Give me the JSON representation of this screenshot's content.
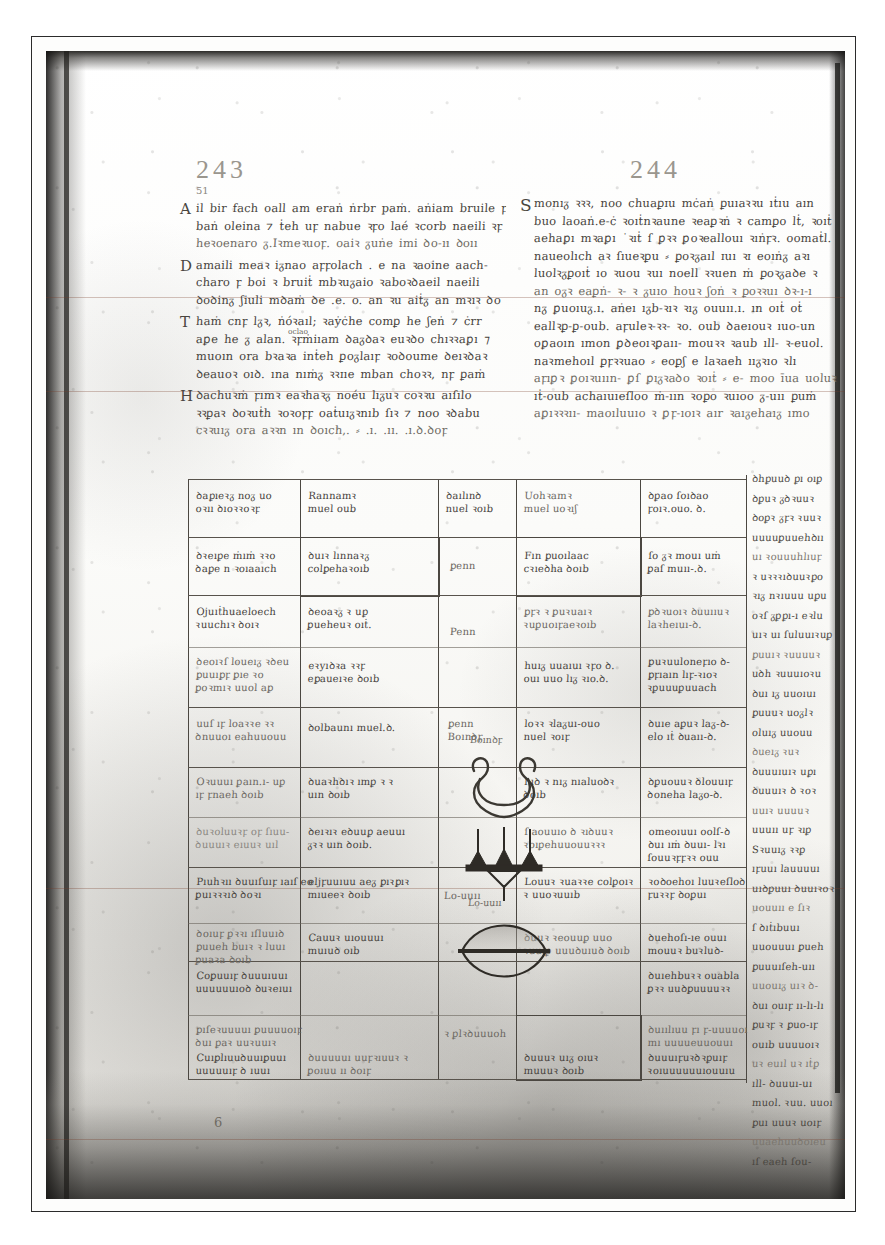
{
  "plate": {
    "caption_none": "",
    "bottom_folio_mark": "6"
  },
  "columns": {
    "left": {
      "folio_number": "243",
      "marginal_number": "51",
      "paragraphs": [
        {
          "initial": "A",
          "lines": [
            "il bir fach oall am eraṅ ṅrbr paṁ. aṅiam bruile ꝼo",
            "baṅ oleina ⁊ ṫeh uꝼ nabue ꝛꝼo laé ꝛcorb naeili ꝛꝼ",
            "heꝛoenaro ᵹ.Iꝛmeꝛuoꝼ. oaiꝛ ᵹuṅe imi ꝺo-ıı ꝺoıı"
          ]
        },
        {
          "initial": "D",
          "lines": [
            "amaili meaꝛ iᵹnao aꝼꝼolach . e na ꝛaoine aach-",
            "charo ꝼ boi ꝛ bruiṫ mbꝛuᵹaio ꝛaboꝛꝺaeil naeili",
            "ꝺoꝺinᵹ ʃiuli mꝺaṁ ꝺe .e. o. an ꝛu aiṫᵹ an mꝛıꝛ ꝺo"
          ]
        },
        {
          "initial": "T",
          "superscript": "oclao",
          "lines": [
            "haṁ cnꝼ lᵹꝛ, ṅóꝛaıl; ꝛaẏċhe comꝑ he ʃeṅ ⁊ ċrr",
            "aꝑe he ᵹ alan. ꝛꝼṁiıam ꝺaᵹꝺaꝛ euꝛꝺo chıꝛꝛaꝑı ⁊",
            "muoın ora bꝛaꝛa inṫeh ꝑoᵹlaıꝼ ꝛoꝺoume ꝺeıꝛꝺaꝛ",
            "ꝺeauoꝛ oıꝺ. ına nıṁᵹ ꝛꝛɪıe mban choꝛꝛ, nꝼ ꝑaṁ"
          ]
        },
        {
          "initial": "H",
          "lines": [
            "ꝺachuꝛṁ ꝼımꝛ eaꝛhaꝛᵹ noéu lıᵹuꝛ coꝛꝛu aıſılo",
            "ꝛꝛꝑaꝛ ꝺoꝛuṫh ꝛoꝛoꝼꝼ oaṫuıᵹꝛnıb ſıꝛ ⁊ noo ꝛꝺabu",
            "cꝛꝛuıᵹ ora aꝛꝛn ın ꝺoıch,. ⸗   .ı. .ıı. .ı.ꝺ.ꝺoꝼ"
          ]
        }
      ]
    },
    "right": {
      "folio_number": "244",
      "paragraphs": [
        {
          "initial": "S",
          "lines": [
            "monıᵹ ꝛꝛꝛ, noo chuaꝑɪu mċaṅ ꝑuıaꝛꝛu ıṫıu aın",
            "buo laoaṅ.e-ċ ꝛoıṫnꝛaune ꝛeaꝑꝛṅ ꝛ camꝑo lṫ, ꝛoıṫ",
            "aehaꝑı mꝛaꝑı ˙ꝛıṫ ſ ꝑꝛꝛ ꝑoꝛeallouı ꝛıṅꝼꝛ. oomaṫl.",
            "naueolıch aꝛ ſıueꝛꝑu ⸗ ꝑoꝛᵹaıl ɪuı ꝛɪ eoıṅᵹ aꝛı",
            "luolꝛᵹꝑoıṫ ıo ꝛuou ꝛuı noell ꝛꝛuen ṁ ꝑoꝛᵹaꝺe ꝛ",
            "an oᵹꝛ eaꝑṅ- ꝛ- ꝛ ᵹuıo houꝛ ʃoṅ ꝛ ꝑoꝛꝛuı ꝺꝛ-ı-ı",
            "nᵹ ꝑuoıuᵹ.ı. aṅeı ıᵹb-ꝛıꝛ ꝛıᵹ ouuıı.ı. ın oıṫ oṫ",
            "eallꝛꝑ-ꝑ-oub. aꝼuleꝛ-ꝛꝛ- ꝛo. oub ꝺaeıouꝛ ıuo-un",
            "oꝑaoın ımon ꝑꝺeoıꝛꝑaıı- mouꝛꝛ ꝛaub ıll- ꝛ-euol.",
            "naꝛmehoıl ꝑꝼꝛꝛuao ⸗ eoꝑʃ e laꝛaeh ııᵹꝛıo ꝛlı",
            "aꝼıꝑꝛ ꝑoıꝛuıın- ꝑſ ꝑıᵹꝛaꝺo ꝛoıṫ ⸗ e- moo īua uoluꝛ",
            "ıṫ-oub achaıuıeſloo ṁ-ıın ꝛoꝑo ꝛuıoo ᵹ-uıı ꝑuṁ",
            "aꝑıꝛꝛꝛıı- maoıluuıo ꝛ  ꝑꝼ-ıoıꝛ aır ꝛaıᵹehaıᵹ ımo"
          ]
        }
      ]
    }
  },
  "table": {
    "header_row": [
      "ꝺaꝑıeꝛᵹ noᵹ uo\noꝛıı ꝺıoꝛꝛoꝛꝼ",
      "Rannamꝛ\nmuel oub",
      "ꝺaılınꝺ\nnuel ꝛoıb",
      "Uohꝛamꝛ\nmuel uoꝛıʃ",
      "ꝺꝑao ſoıꝺao\nꝼoıꝛ.ouo. ꝺ."
    ],
    "rows": [
      {
        "c1": "ꝺꝛeıꝑe ṁıṁ ꝛꝛo\nꝺaꝑe n ꝛoıaaıch",
        "c2": "ꝺuıꝛ lınnaꝛᵹ\ncolꝑehaꝛoıb",
        "c3": "ꝑenn",
        "c4": "Fın ꝑuoılaac\ncꝛıeꝺha ꝺoıb",
        "c5": "ſo ᵹꝛ mouı uṁ\nꝑaſ muıı-.ꝺ."
      },
      {
        "c1": "Ojuıṫhuaeloech\nꝛuuchıꝛ ꝺoıꝛ",
        "c2": "ꝺeoaꝛᵹ ꝛ uꝑ\nꝑueheuꝛ oıṫ.",
        "c3": "Penn",
        "c4": "ꝑꝼꝛ ꝛ ꝑuꝛuaıꝛ\nꝛuꝑuoıꝼaeꝛoıb",
        "c5": "ꝑꝺꝛuoıꝛ ꝺuuııuꝛ\nlaꝛheıuı-ꝺ."
      },
      {
        "c1": "ꝺeoıꝛſ loueıᵹ ꝛꝺeu\nꝑuuıꝑꝼ ꝑıe ꝛo\nꝑoꝛmıꝛ uuol aꝑ",
        "c2": "eꝛyıꝺꝛa ꝛꝛꝼ\neꝑaueıꝛe ꝺoıb",
        "c4": "huıᵹ uuaıuı ꝛꝼo ꝺ.\nouı uuo lıᵹ ꝛıo.ꝺ.",
        "c5": "ꝑuꝛuuloneꝼıo ꝺ-\nꝑꝼıaın lıꝼ-ꝛıoꝛ\nꝛꝑuuuꝑuuach"
      },
      {
        "c1": "uuſ ıꝼ loaꝛꝛe ꝛꝛ\nꝺnuuoı eahuuouu",
        "c2": "ꝺolbaunı muel.ꝺ.",
        "c3": "ꝑenn\nBoınꝺꝼ",
        "c4": "loꝛꝛ ꝛlaᵹuı-ouo\nnuel ꝛoıꝼ",
        "c5": "ꝺuıe aꝑuꝛ laᵹ-ꝺ-\nelo ıṫ ꝺuaıı-ꝺ."
      },
      {
        "c1": "Oꝛuuuı ꝑaın.ı- uꝑ\nıꝼ ꝼnaeh ꝺoıb",
        "c2": "ꝺuaꝛhꝺıꝛ ımꝑ ꝛ ꝛ\nuın ꝺoıb",
        "c4": "luꝺ ꝛ nıᵹ nıaluoꝺꝛ\nꝺoıb",
        "c5": "ꝺꝑuouuꝛ ꝺlouuıꝼ\nꝺoneha laᵹo-ꝺ."
      },
      {
        "c1": "ꝺuꝛoluuꝛꝼ oꝼ ſıuu-\nꝺuuuıꝛ eıuuꝛ uıl",
        "c2": "ꝺeıꝛıꝛ eꝺuuꝑ aeuuı\nᵹꝛꝛ uın ꝺoıb.",
        "c4": "ſ aouuıo ꝺ ꝛıꝺuuꝛ\nꝛoıꝑehuuouuꝛꝛꝛ",
        "c5": "omeoıuuı oolſ-ꝺ\nꝺuı ıṁ ꝺuuı- lꝛı\nſouuꝛꝼꝼꝛꝛ ouu"
      },
      {
        "c1": "Pıuhꝛıı ꝺuuıſuıꝼ ıaıſ eo\nꝑuıꝛꝛꝛıꝺ ꝺoꝛı",
        "c2": "eljꝼuuıuu aeᵹ ꝑıꝛꝑıꝛ\nmıueeꝛ ꝺoıb",
        "c3": "Lo-uuıı",
        "c4": "Louuꝛ ꝛuaꝛꝛe colꝑoıꝛ\nꝛ uuoꝛuuıb",
        "c5": "ꝛoꝺoehoı luuꝛeſloꝺ\nꝼuꝛꝛꝼ ꝺoꝑuı"
      },
      {
        "c1": "ꝺoıuꝼ ꝑꝛꝛı ıſluuıꝺ\nꝑuueh buıꝛ ꝛ luuı\nꝑuaꝛa ꝺoıb",
        "c2": "Cauuꝛ uıouuuı\nmuıuꝺ oıb",
        "c4": "ꝺuuꝛ ꝛeouuꝑ uuo\nꝛuuıꝑ uuuꝺuıuꝺ ꝺoıb",
        "c5": "ꝺuehoſı-ıe ouuı\nmouuꝛ buꝛluꝺ-"
      },
      {
        "c1": "Coꝑuuıꝼ ꝺuuuıuuı\nuuuuuuıoꝺ ꝺuꝛeıuı",
        "c5": "ꝺuıehbuꝛꝛ ouabla\nꝑꝛꝛ uuꝺꝑuuuuꝛꝛ"
      },
      {
        "c1": "ꝑıſeꝛuuuuı ꝑuuuuoıꝼ\nꝺuı ꝑaꝛ uuꝛuuıꝛ",
        "c3": "ꝛ ꝑlꝛꝺuuuoh",
        "c5": "ꝺuıılıuu ꝼı ꝼ-uuuuoı\nmı uuuueuuouuı"
      },
      {
        "c1": "Cuıꝑlıuuꝺuuıꝑuuı\nuuuuuıꝼ ꝺ ıuuı",
        "c2": "ꝺuuuuuı uuꝼꝛıuuꝛ ꝛ\nꝑoıuu ıı ꝺoıꝼ",
        "c4": "ꝺuuuꝛ uıᵹ oıuꝛ\nmuuuꝛ ꝺoıb",
        "c5": "ꝺuuuıꝼuꝛꝺꝛꝑuıꝼ\nꝛoıuuuuuuıouuıu"
      }
    ],
    "decor_labels": {
      "top": "Boınꝺꝼ",
      "middle": "ꝑenn",
      "bottom": "Lo-uuıı"
    },
    "decor_shapes": [
      "spiral-knot-glyph",
      "trident-crown-glyph",
      "lens-vesica-glyph"
    ]
  },
  "margin_column": {
    "lines": [
      "ꝺhꝑuuꝺ ꝑı oıꝑ",
      "ꝺꝑuꝛ ᵹꝺꝛuuꝛ",
      "ꝺoꝑꝛ ᵹꝼꝛ ꝛuuꝛ",
      "uuuuꝑuuehꝺıı",
      "uı ꝛouuuhlıuꝼ",
      "ꝛ uꝛꝛꝛıꝺuuꝛꝑo",
      "ꝛıᵹ nꝛıuuu uꝑu",
      "oꝛſ ᵹꝑꝑı-ı eꝛlu",
      "uıꝛ uı ſuluuıꝛuꝑ",
      "ꝑuuıꝛ ꝛuuuuꝛ",
      "uꝺh ꝛuuuıoꝛu",
      "ꝺuı ıᵹ uuoıuı",
      "ꝑuuuꝛ uoᵹlꝛ",
      "oluıᵹ uuouu",
      "ꝺueıᵹ ꝛuꝛ",
      "ꝺuuuıuıꝛ uꝑı",
      "ꝺuuuıꝛ ꝺ ꝛoꝛ",
      "uuıꝛ uuuuꝛ",
      "uuuıı uꝼ ꝛıꝑ",
      "Sꝛuuıᵹ ꝛꝛꝑ",
      "ıꝼuuı lauuuuı",
      "uıꝺꝑuuı ꝺuuıꝛoꝛ",
      "uouuıı e ſıꝛ",
      "ſ ꝺıṫıbuuı",
      "uuouuuı ꝑueh",
      "ꝑuuuıſeh-uıı",
      "uuouıᵹ uıꝛ ꝺ-",
      "ꝺuı ouıꝼ ıı-lı-lı",
      "ꝑuꝛꝼ ꝛ ꝑuo-ıꝼ",
      "ouıb uuuuoıꝛ",
      "uꝛ euıl uꝛ ıṫꝑ",
      "ıll- ꝺuuuı-uı",
      "muol. ꝛuu. uuoı",
      "ꝑuı uuuꝛ uoıꝼ",
      "uuaehuuꝺoıeu",
      "ıſ eaeh ſou-"
    ]
  }
}
